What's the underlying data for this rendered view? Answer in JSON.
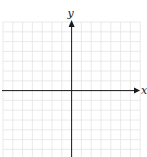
{
  "diagram": {
    "type": "coordinate-plane",
    "x_axis_label": "x",
    "y_axis_label": "y",
    "grid": {
      "columns": 14,
      "rows": 14,
      "left": 3,
      "top": 22,
      "cell": 9.8,
      "color": "#e4e4e4"
    },
    "origin": {
      "x": 71.6,
      "y": 90.6
    },
    "axis_color": "#1a1a1a"
  }
}
